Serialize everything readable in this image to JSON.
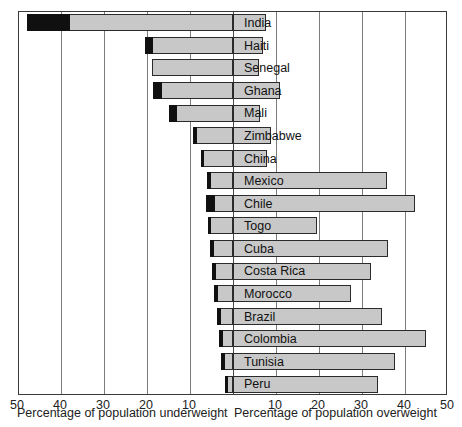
{
  "chart_data": {
    "type": "bar",
    "title": "",
    "subtitle": "",
    "orientation": "horizontal",
    "style": "diverging double-sided bar chart (population pyramid style)",
    "axis_left": {
      "label": "Percentage of population underweight",
      "ticks": [
        50,
        40,
        30,
        20,
        10
      ],
      "range": [
        50,
        0
      ],
      "direction": "right-to-left"
    },
    "axis_right": {
      "label": "Percentage of population overweight",
      "ticks": [
        10,
        20,
        30,
        40,
        50
      ],
      "range": [
        0,
        50
      ],
      "direction": "left-to-right"
    },
    "grid": true,
    "legend": null,
    "colors": {
      "underweight_moderate": "#c8c8c8",
      "underweight_severe": "#101010",
      "overweight": "#c8c8c8",
      "outline": "#2b2b2b",
      "gridline": "#7c7c7c",
      "frame": "#3a3a3a"
    },
    "series": [
      {
        "name": "Severe underweight",
        "note": "black segment at far-left end of each left bar"
      },
      {
        "name": "Underweight total",
        "note": "grey + black segment left of zero"
      },
      {
        "name": "Overweight",
        "note": "grey bar right of zero"
      }
    ],
    "categories": [
      "India",
      "Haiti",
      "Senegal",
      "Ghana",
      "Mali",
      "Zimbabwe",
      "China",
      "Mexico",
      "Chile",
      "Togo",
      "Cuba",
      "Costa Rica",
      "Morocco",
      "Brazil",
      "Colombia",
      "Tunisia",
      "Peru"
    ],
    "rows": [
      {
        "country": "India",
        "underweight": 48.0,
        "severe": 38.0,
        "overweight": 7.7
      },
      {
        "country": "Haiti",
        "underweight": 20.5,
        "severe": 18.5,
        "overweight": 7.0
      },
      {
        "country": "Senegal",
        "underweight": 18.8,
        "severe": 18.8,
        "overweight": 6.0
      },
      {
        "country": "Ghana",
        "underweight": 18.6,
        "severe": 16.5,
        "overweight": 11.0
      },
      {
        "country": "Mali",
        "underweight": 14.9,
        "severe": 13.0,
        "overweight": 6.3
      },
      {
        "country": "Zimbabwe",
        "underweight": 9.3,
        "severe": 8.4,
        "overweight": 8.8
      },
      {
        "country": "China",
        "underweight": 7.4,
        "severe": 6.7,
        "overweight": 8.0
      },
      {
        "country": "Mexico",
        "underweight": 6.0,
        "severe": 5.1,
        "overweight": 35.8
      },
      {
        "country": "Chile",
        "underweight": 6.3,
        "severe": 4.2,
        "overweight": 42.3
      },
      {
        "country": "Togo",
        "underweight": 5.8,
        "severe": 5.1,
        "overweight": 19.5
      },
      {
        "country": "Cuba",
        "underweight": 5.3,
        "severe": 4.4,
        "overweight": 36.0
      },
      {
        "country": "Costa Rica",
        "underweight": 4.9,
        "severe": 4.0,
        "overweight": 32.1
      },
      {
        "country": "Morocco",
        "underweight": 4.4,
        "severe": 3.5,
        "overweight": 27.4
      },
      {
        "country": "Brazil",
        "underweight": 3.7,
        "severe": 2.8,
        "overweight": 34.6
      },
      {
        "country": "Colombia",
        "underweight": 3.3,
        "severe": 2.3,
        "overweight": 44.9
      },
      {
        "country": "Tunisia",
        "underweight": 2.8,
        "severe": 1.9,
        "overweight": 37.7
      },
      {
        "country": "Peru",
        "underweight": 1.9,
        "severe": 1.2,
        "overweight": 33.7
      }
    ]
  },
  "tick_labels_left": [
    "50",
    "40",
    "30",
    "20",
    "10"
  ],
  "tick_labels_right": [
    "10",
    "20",
    "30",
    "40",
    "50"
  ],
  "caption_left": "Percentage of population underweight",
  "caption_right": "Percentage of population overweight"
}
